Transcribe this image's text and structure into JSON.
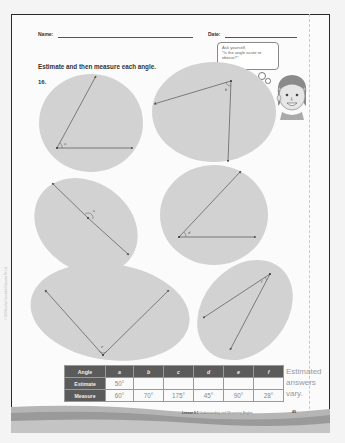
{
  "header": {
    "name_label": "Name:",
    "date_label": "Date:"
  },
  "instruction": "Estimate and then measure each angle.",
  "question_number": "16.",
  "thought_bubble": {
    "line1": "Ask yourself,",
    "line2": "\"Is the angle acute or",
    "line3": "obtuse?\""
  },
  "side_copyright": "© 2020 Marshall Cavendish Education Pte Ltd",
  "angle_labels": {
    "a": "a",
    "b": "b",
    "c": "c",
    "d": "d",
    "e": "e",
    "f": "f"
  },
  "table": {
    "header": [
      "Angle",
      "a",
      "b",
      "c",
      "d",
      "e",
      "f"
    ],
    "rows": [
      {
        "label": "Estimate",
        "values": [
          "50°",
          "",
          "",
          "",
          "",
          ""
        ]
      },
      {
        "label": "Measure",
        "values": [
          "60°",
          "70°",
          "175°",
          "45°",
          "90°",
          "28°"
        ]
      }
    ]
  },
  "note": {
    "line1": "Estimated",
    "line2": "answers",
    "line3": "vary."
  },
  "footer": {
    "lesson": "Lesson 9.1",
    "title": "Understanding and Measuring Angles",
    "page": "49"
  },
  "colors": {
    "blob": "#d2d2d2",
    "table_header": "#5b5b5b",
    "border": "#2a2a2a"
  }
}
